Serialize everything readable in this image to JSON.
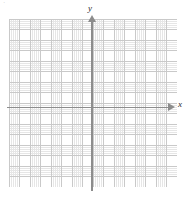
{
  "figure": {
    "title": "",
    "corner_mark": "·"
  },
  "chart_data": {
    "type": "scatter",
    "title": "",
    "subtitle": "",
    "xlabel": "x",
    "ylabel": "y",
    "series": [],
    "x": [],
    "values": [],
    "xlim": [
      -8,
      8
    ],
    "ylim": [
      -8,
      8
    ],
    "x_major_step": 1,
    "y_major_step": 1,
    "minor_subdivisions": 5,
    "grid": true,
    "grid_major_color": "#c9c9c9",
    "grid_minor_color": "#e6e6e6",
    "axis_color": "#8c8c8c",
    "label_color": "#2b2b2b",
    "background": "#ffffff",
    "legend": "none",
    "tick_labels_x": [],
    "tick_labels_y": [],
    "annotations": []
  },
  "axes": {
    "x": {
      "label": "x",
      "arrow_direction": "right",
      "arrow_icon": "arrow-right-icon"
    },
    "y": {
      "label": "y",
      "arrow_direction": "up",
      "arrow_icon": "arrow-up-icon"
    }
  }
}
